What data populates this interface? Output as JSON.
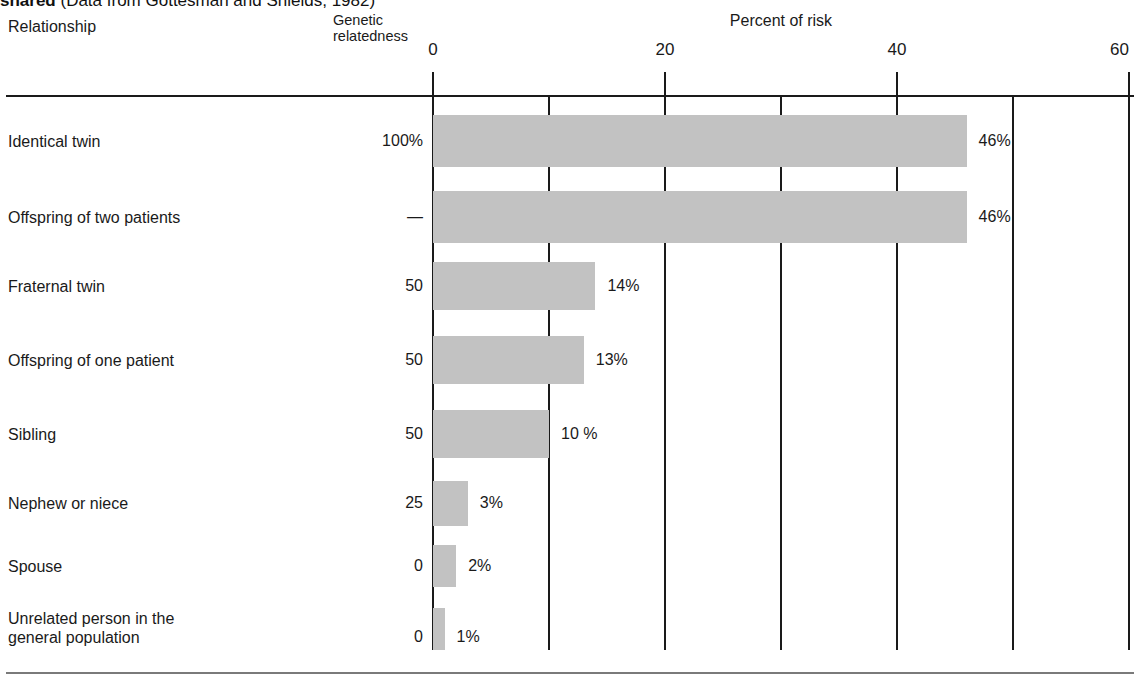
{
  "caption": {
    "bold_part": "shared",
    "rest_part": " (Data from Gottesman and Shields, 1982)"
  },
  "header": {
    "relationship_label": "Relationship",
    "genetic_relatedness_label": "Genetic\nrelatedness",
    "percent_of_risk_label": "Percent of risk"
  },
  "colors": {
    "bar_fill": "#c2c2c2",
    "axis": "#1a1a1a",
    "text": "#1a1a1a",
    "background": "#ffffff"
  },
  "axis": {
    "tick_labels": [
      "0",
      "20",
      "40",
      "60"
    ],
    "tick_values": [
      0,
      20,
      40,
      60
    ],
    "gridline_values": [
      0,
      10,
      20,
      30,
      40,
      50,
      60
    ],
    "min": 0,
    "max": 60
  },
  "chart_data": {
    "type": "bar",
    "orientation": "horizontal",
    "title": "shared (Data from Gottesman and Shields, 1982)",
    "xlabel": "Percent of risk",
    "ylabel": "Relationship",
    "xlim": [
      0,
      60
    ],
    "grid": true,
    "legend": "none",
    "columns": [
      "Relationship",
      "Genetic relatedness",
      "Percent of risk"
    ],
    "categories": [
      "Identical twin",
      "Offspring of two patients",
      "Fraternal twin",
      "Offspring of one patient",
      "Sibling",
      "Nephew or niece",
      "Spouse",
      "Unrelated person in the general population"
    ],
    "values": [
      46,
      46,
      14,
      13,
      10,
      3,
      2,
      1
    ],
    "value_labels": [
      "46%",
      "46%",
      "14%",
      "13%",
      "10 %",
      "3%",
      "2%",
      "1%"
    ],
    "genetic_relatedness": [
      "100%",
      "—",
      "50",
      "50",
      "50",
      "25",
      "0",
      "0"
    ]
  },
  "rows": [
    {
      "label": "Identical twin",
      "relatedness": "100%",
      "value": 46,
      "value_label": "46%",
      "top": 115,
      "height": 52,
      "label_top": 132,
      "value_top": 132
    },
    {
      "label": "Offspring of two patients",
      "relatedness": "—",
      "value": 46,
      "value_label": "46%",
      "top": 191,
      "height": 52,
      "label_top": 208,
      "value_top": 208
    },
    {
      "label": "Fraternal twin",
      "relatedness": "50",
      "value": 14,
      "value_label": "14%",
      "top": 262,
      "height": 48,
      "label_top": 277,
      "value_top": 277
    },
    {
      "label": "Offspring of one patient",
      "relatedness": "50",
      "value": 13,
      "value_label": "13%",
      "top": 336,
      "height": 48,
      "label_top": 351,
      "value_top": 351
    },
    {
      "label": "Sibling",
      "relatedness": "50",
      "value": 10,
      "value_label": "10 %",
      "top": 410,
      "height": 48,
      "label_top": 425,
      "value_top": 425
    },
    {
      "label": "Nephew or niece",
      "relatedness": "25",
      "value": 3,
      "value_label": "3%",
      "top": 481,
      "height": 45,
      "label_top": 494,
      "value_top": 494
    },
    {
      "label": "Spouse",
      "relatedness": "0",
      "value": 2,
      "value_label": "2%",
      "top": 545,
      "height": 42,
      "label_top": 557,
      "value_top": 557
    },
    {
      "label": "Unrelated person in the\ngeneral population",
      "relatedness": "0",
      "value": 1,
      "value_label": "1%",
      "top": 608,
      "height": 42,
      "label_top": 609,
      "value_top": 628
    }
  ]
}
